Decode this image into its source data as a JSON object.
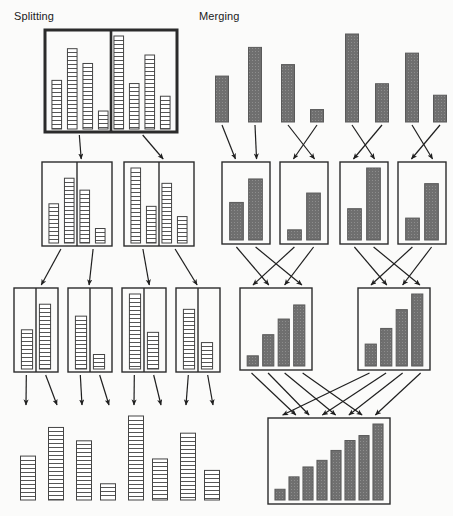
{
  "titles": {
    "splitting": "Splitting",
    "merging": "Merging"
  },
  "colors": {
    "stroke": "#2b2b2b",
    "merge_fill": "#6f6f6f",
    "merge_fill_dark": "#5a5a5a",
    "split_fill": "#ffffff",
    "split_stripe": "#444444",
    "background": "#fbfbfa",
    "arrow": "#1f1f1f"
  },
  "chart_data": {
    "type": "diagram",
    "panels": [
      {
        "name": "splitting",
        "label": "Splitting",
        "direction": "top-down",
        "bar_style": "horizontal-striped",
        "levels": [
          {
            "level": 0,
            "boxes": [
              {
                "id": "s-root",
                "x": 45,
                "y": 30,
                "w": 132,
                "h": 102,
                "thick": true,
                "dividers": [
                  4
                ],
                "values": [
                  46,
                  76,
                  62,
                  17,
                  88,
                  43,
                  70,
                  31
                ]
              }
            ]
          },
          {
            "level": 1,
            "boxes": [
              {
                "id": "s-l1a",
                "x": 42,
                "y": 162,
                "w": 70,
                "h": 84,
                "thick": false,
                "dividers": [
                  2
                ],
                "values": [
                  46,
                  76,
                  62,
                  17
                ]
              },
              {
                "id": "s-l1b",
                "x": 124,
                "y": 162,
                "w": 70,
                "h": 84,
                "thick": false,
                "dividers": [
                  2
                ],
                "values": [
                  88,
                  43,
                  70,
                  31
                ]
              }
            ]
          },
          {
            "level": 2,
            "boxes": [
              {
                "id": "s-l2a",
                "x": 14,
                "y": 288,
                "w": 44,
                "h": 84,
                "thick": false,
                "dividers": [
                  1
                ],
                "values": [
                  46,
                  76
                ]
              },
              {
                "id": "s-l2b",
                "x": 68,
                "y": 288,
                "w": 44,
                "h": 84,
                "thick": false,
                "dividers": [
                  1
                ],
                "values": [
                  62,
                  17
                ]
              },
              {
                "id": "s-l2c",
                "x": 122,
                "y": 288,
                "w": 44,
                "h": 84,
                "thick": false,
                "dividers": [
                  1
                ],
                "values": [
                  88,
                  43
                ]
              },
              {
                "id": "s-l2d",
                "x": 176,
                "y": 288,
                "w": 44,
                "h": 84,
                "thick": false,
                "dividers": [
                  1
                ],
                "values": [
                  70,
                  31
                ]
              }
            ]
          },
          {
            "level": 3,
            "leaves": [
              {
                "cx": 28,
                "value": 46
              },
              {
                "cx": 56,
                "value": 76
              },
              {
                "cx": 84,
                "value": 62
              },
              {
                "cx": 108,
                "value": 17
              },
              {
                "cx": 136,
                "value": 88
              },
              {
                "cx": 160,
                "value": 43
              },
              {
                "cx": 188,
                "value": 70
              },
              {
                "cx": 212,
                "value": 31
              }
            ],
            "leaf_baseline": 500,
            "leaf_width": 15,
            "leaf_max_height": 84
          }
        ]
      },
      {
        "name": "merging",
        "label": "Merging",
        "direction": "bottom-up",
        "bar_style": "solid-gray-textured",
        "levels": [
          {
            "level": 0,
            "singles": [
              {
                "cx": 222,
                "value": 48
              },
              {
                "cx": 255,
                "value": 78
              },
              {
                "cx": 288,
                "value": 60
              },
              {
                "cx": 317,
                "value": 13
              },
              {
                "cx": 352,
                "value": 92
              },
              {
                "cx": 382,
                "value": 40
              },
              {
                "cx": 412,
                "value": 72
              },
              {
                "cx": 440,
                "value": 28
              }
            ],
            "baseline": 122,
            "bar_width": 13,
            "max_height": 88
          },
          {
            "level": 1,
            "boxes": [
              {
                "id": "m-l1a",
                "x": 222,
                "y": 162,
                "w": 48,
                "h": 82,
                "values": [
                  48,
                  78
                ]
              },
              {
                "id": "m-l1b",
                "x": 280,
                "y": 162,
                "w": 48,
                "h": 82,
                "values": [
                  13,
                  60
                ]
              },
              {
                "id": "m-l1c",
                "x": 340,
                "y": 162,
                "w": 48,
                "h": 82,
                "values": [
                  40,
                  92
                ]
              },
              {
                "id": "m-l1d",
                "x": 398,
                "y": 162,
                "w": 48,
                "h": 82,
                "values": [
                  28,
                  72
                ]
              }
            ]
          },
          {
            "level": 2,
            "boxes": [
              {
                "id": "m-l2a",
                "x": 240,
                "y": 288,
                "w": 72,
                "h": 82,
                "values": [
                  13,
                  40,
                  60,
                  78
                ]
              },
              {
                "id": "m-l2b",
                "x": 358,
                "y": 288,
                "w": 72,
                "h": 82,
                "values": [
                  28,
                  48,
                  72,
                  92
                ]
              }
            ]
          },
          {
            "level": 3,
            "boxes": [
              {
                "id": "m-root",
                "x": 268,
                "y": 418,
                "w": 122,
                "h": 86,
                "values": [
                  13,
                  28,
                  40,
                  48,
                  60,
                  72,
                  78,
                  92
                ]
              }
            ]
          }
        ]
      }
    ]
  }
}
